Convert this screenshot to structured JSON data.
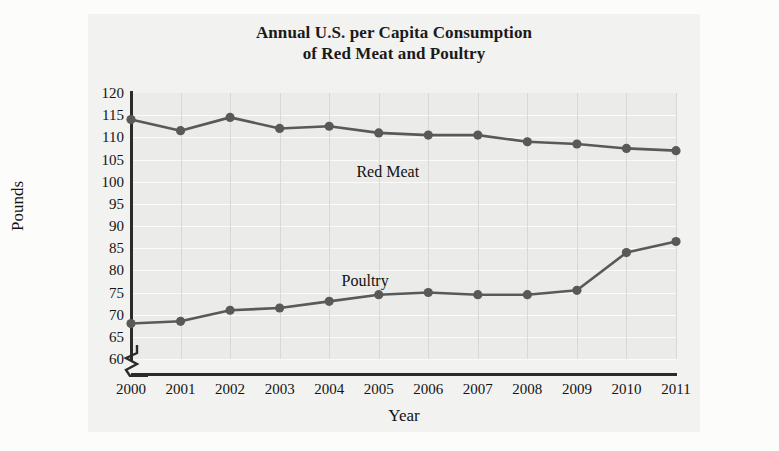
{
  "figure": {
    "title_line1": "Annual U.S. per Capita Consumption",
    "title_line2": "of Red Meat and Poultry",
    "background_color": "#f2f2f0",
    "plot_background_color": "#ebebe9",
    "axis_color": "#2b2b2b",
    "series_color": "#595959",
    "gridline_color": "#fbfbfa"
  },
  "axis": {
    "ylabel": "Pounds",
    "xlabel": "Year",
    "y_break_symbol": "axis-break-zigzag"
  },
  "labels": {
    "red_meat": "Red Meat",
    "poultry": "Poultry"
  },
  "chart_data": {
    "type": "line",
    "title": "Annual U.S. per Capita Consumption of Red Meat and Poultry",
    "xlabel": "Year",
    "ylabel": "Pounds",
    "categories": [
      "2000",
      "2001",
      "2002",
      "2003",
      "2004",
      "2005",
      "2006",
      "2007",
      "2008",
      "2009",
      "2010",
      "2011"
    ],
    "x": [
      2000,
      2001,
      2002,
      2003,
      2004,
      2005,
      2006,
      2007,
      2008,
      2009,
      2010,
      2011
    ],
    "ylim": [
      60,
      120
    ],
    "yticks": [
      60,
      65,
      70,
      75,
      80,
      85,
      90,
      95,
      100,
      105,
      110,
      115,
      120
    ],
    "grid": true,
    "axis_break": true,
    "legend": "inline-labels",
    "series": [
      {
        "name": "Red Meat",
        "color": "#595959",
        "values": [
          114,
          111.5,
          114.5,
          112,
          112.5,
          111,
          110.5,
          110.5,
          109,
          108.5,
          107.5,
          107
        ]
      },
      {
        "name": "Poultry",
        "color": "#595959",
        "values": [
          68,
          68.5,
          71,
          71.5,
          73,
          74.5,
          75,
          74.5,
          74.5,
          75.5,
          84,
          86.5
        ]
      }
    ]
  }
}
